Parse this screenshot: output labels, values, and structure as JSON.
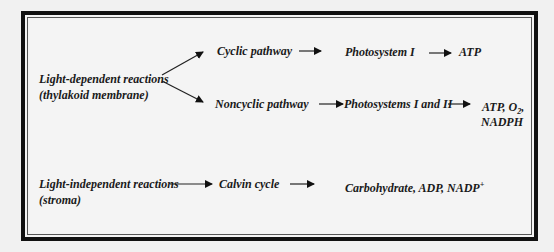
{
  "diagram": {
    "light_dependent": {
      "line1": "Light-dependent reactions",
      "line2": "(thylakoid membrane)"
    },
    "cyclic": {
      "pathway": "Cyclic pathway",
      "system": "Photosystem I",
      "product": "ATP"
    },
    "noncyclic": {
      "pathway": "Noncyclic pathway",
      "system": "Photosystems I and II",
      "product_line1_a": "ATP, O",
      "product_line1_sub": "2",
      "product_line1_b": ",",
      "product_line2": "NADPH"
    },
    "light_independent": {
      "line1": "Light-independent reactions",
      "line2": "(stroma)",
      "cycle": "Calvin cycle",
      "product_a": "Carbohydrate, ADP, NADP",
      "product_sup": "+"
    },
    "colors": {
      "border": "#111111",
      "text": "#1a1a1a",
      "background": "#f1f1f1"
    }
  }
}
